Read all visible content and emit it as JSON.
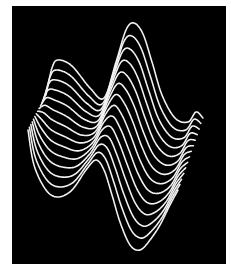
{
  "image": {
    "description": "3D wave surface rendered as white line curves on black background",
    "background_color": "#000000",
    "line_color": "#f2f2f2",
    "curve_count": 14
  },
  "surface": {
    "back_curve": [
      [
        46,
        95
      ],
      [
        52,
        68
      ],
      [
        58,
        60
      ],
      [
        72,
        66
      ],
      [
        90,
        88
      ],
      [
        104,
        98
      ],
      [
        116,
        62
      ],
      [
        126,
        30
      ],
      [
        134,
        23
      ],
      [
        143,
        34
      ],
      [
        152,
        62
      ],
      [
        162,
        95
      ],
      [
        175,
        118
      ],
      [
        188,
        122
      ],
      [
        196,
        112
      ],
      [
        203,
        118
      ]
    ],
    "front_curve": [
      [
        28,
        130
      ],
      [
        34,
        165
      ],
      [
        46,
        190
      ],
      [
        58,
        197
      ],
      [
        72,
        190
      ],
      [
        86,
        170
      ],
      [
        96,
        160
      ],
      [
        104,
        170
      ],
      [
        112,
        195
      ],
      [
        120,
        222
      ],
      [
        130,
        245
      ],
      [
        140,
        250
      ],
      [
        150,
        240
      ],
      [
        160,
        225
      ],
      [
        170,
        205
      ],
      [
        178,
        190
      ]
    ]
  }
}
